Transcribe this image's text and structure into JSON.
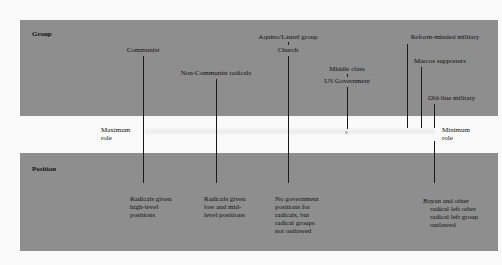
{
  "panels": {
    "top_title": "Group",
    "bottom_title": "Position"
  },
  "axis": {
    "max_label": "Maximum\nrole",
    "min_label": "Minimum\nrole"
  },
  "groups": [
    {
      "label": "Communist",
      "x": 143
    },
    {
      "label": "Non-Communist radicals",
      "x": 216
    },
    {
      "label_top": "Aquino/Laurel group",
      "label_bottom": "Church",
      "x": 288
    },
    {
      "label_top": "Middle class",
      "label_bottom": "US Government",
      "x": 347
    },
    {
      "label": "Reform-minded military",
      "x": 407
    },
    {
      "label": "Marcos supporters",
      "x": 421
    },
    {
      "label": "Old-line military",
      "x": 434
    }
  ],
  "positions": [
    {
      "text": "Radicals given\nhigh-level\npositions",
      "x": 143
    },
    {
      "text": "Radicals given\nlow and mid-\nlevel positions",
      "x": 216
    },
    {
      "text": "No government\npositions for\nradicals, but\nradical groups\nnot outlawed",
      "x": 288
    },
    {
      "text": "Bayan and other\n    radical left other\n    radical left group\n    outlawed",
      "x": 434
    }
  ]
}
